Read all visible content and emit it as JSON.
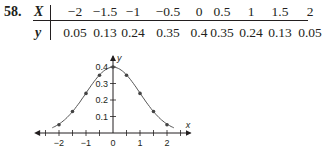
{
  "problem": {
    "number": "58.",
    "x_label": "X",
    "y_label": "y",
    "x_values": [
      "−2",
      "−1.5",
      "−1",
      "−0.5",
      "0",
      "0.5",
      "1",
      "1.5",
      "2"
    ],
    "y_values": [
      "0.05",
      "0.13",
      "0.24",
      "0.35",
      "0.4",
      "0.35",
      "0.24",
      "0.13",
      "0.05"
    ]
  },
  "chart_data": {
    "type": "line",
    "title": "",
    "xlabel": "x",
    "ylabel": "y",
    "x": [
      -2,
      -1.5,
      -1,
      -0.5,
      0,
      0.5,
      1,
      1.5,
      2
    ],
    "series": [
      {
        "name": "y",
        "values": [
          0.05,
          0.13,
          0.24,
          0.35,
          0.4,
          0.35,
          0.24,
          0.13,
          0.05
        ],
        "markers": true,
        "smooth_curve": "normal density"
      }
    ],
    "x_tick_labels": [
      "−2",
      "−1",
      "0",
      "1",
      "2"
    ],
    "y_tick_labels": [
      "0.1",
      "0.2",
      "0.3",
      "0.4"
    ],
    "xlim": [
      -2.5,
      2.5
    ],
    "ylim": [
      0,
      0.42
    ],
    "grid": false,
    "legend": "none"
  },
  "colors": {
    "ink": "#231f20",
    "curve": "#555555",
    "marker": "#444444"
  }
}
